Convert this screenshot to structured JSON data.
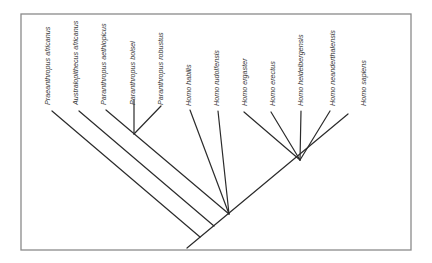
{
  "diagram": {
    "type": "cladogram",
    "colors": {
      "frame": "#8a8a8a",
      "branch": "#2b2b2b",
      "label": "#3a3a3a",
      "background": "#ffffff"
    },
    "taxa": [
      {
        "id": "praeanthropus-africanus",
        "label": "Praeanthropus africanus"
      },
      {
        "id": "australopithecus-africanus",
        "label": "Australopithecus africanus"
      },
      {
        "id": "paranthropus-aethiopicus",
        "label": "Paranthropus aethiopicus"
      },
      {
        "id": "paranthropus-boisei",
        "label": "Paranthropus boisei"
      },
      {
        "id": "paranthropus-robustus",
        "label": "Paranthropus robustus"
      },
      {
        "id": "homo-habilis",
        "label": "Homo habilis"
      },
      {
        "id": "homo-rudolfensis",
        "label": "Homo rudolfensis"
      },
      {
        "id": "homo-ergaster",
        "label": "Homo ergaster"
      },
      {
        "id": "homo-erectus",
        "label": "Homo erectus"
      },
      {
        "id": "homo-heidelbergensis",
        "label": "Homo heidelbergensis"
      },
      {
        "id": "homo-neanderthalensis",
        "label": "Homo neanderthalensis"
      },
      {
        "id": "homo-sapiens",
        "label": "Homo sapiens"
      }
    ]
  }
}
